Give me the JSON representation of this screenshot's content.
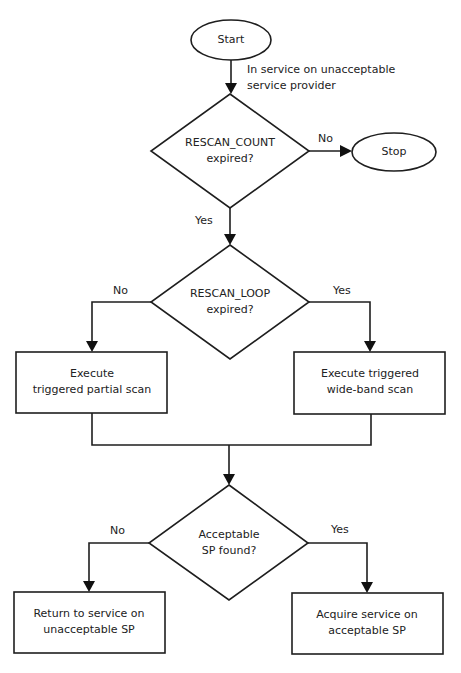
{
  "diagram": {
    "type": "flowchart",
    "nodes": {
      "start": {
        "shape": "ellipse",
        "label": "Start"
      },
      "stop": {
        "shape": "ellipse",
        "label": "Stop"
      },
      "decision_rescan_count": {
        "shape": "diamond",
        "line1": "RESCAN_COUNT",
        "line2": "expired?"
      },
      "decision_rescan_loop": {
        "shape": "diamond",
        "line1": "RESCAN_LOOP",
        "line2": "expired?"
      },
      "partial_scan": {
        "shape": "rect",
        "line1": "Execute",
        "line2": "triggered partial scan"
      },
      "wideband_scan": {
        "shape": "rect",
        "line1": "Execute triggered",
        "line2": "wide-band scan"
      },
      "decision_acceptable_sp": {
        "shape": "diamond",
        "line1": "Acceptable",
        "line2": "SP found?"
      },
      "return_service": {
        "shape": "rect",
        "line1": "Return to service on",
        "line2": "unacceptable SP"
      },
      "acquire_service": {
        "shape": "rect",
        "line1": "Acquire service on",
        "line2": "acceptable SP"
      }
    },
    "edge_labels": {
      "start_note_line1": "In service on unacceptable",
      "start_note_line2": "service provider",
      "count_no": "No",
      "count_yes": "Yes",
      "loop_no": "No",
      "loop_yes": "Yes",
      "sp_no": "No",
      "sp_yes": "Yes"
    },
    "edges": [
      {
        "from": "start",
        "to": "decision_rescan_count",
        "label": "In service on unacceptable service provider"
      },
      {
        "from": "decision_rescan_count",
        "to": "stop",
        "label": "No"
      },
      {
        "from": "decision_rescan_count",
        "to": "decision_rescan_loop",
        "label": "Yes"
      },
      {
        "from": "decision_rescan_loop",
        "to": "partial_scan",
        "label": "No"
      },
      {
        "from": "decision_rescan_loop",
        "to": "wideband_scan",
        "label": "Yes"
      },
      {
        "from": "partial_scan",
        "to": "decision_acceptable_sp",
        "label": ""
      },
      {
        "from": "wideband_scan",
        "to": "decision_acceptable_sp",
        "label": ""
      },
      {
        "from": "decision_acceptable_sp",
        "to": "return_service",
        "label": "No"
      },
      {
        "from": "decision_acceptable_sp",
        "to": "acquire_service",
        "label": "Yes"
      }
    ],
    "colors": {
      "stroke": "#1e1e1e",
      "text": "#222222",
      "background": "#ffffff"
    }
  }
}
